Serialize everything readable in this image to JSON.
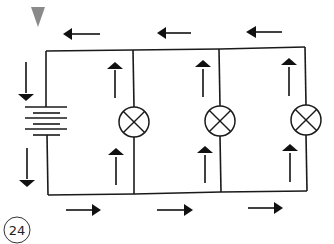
{
  "figure": {
    "number_label": "24",
    "colors": {
      "line": "#1a1a1a",
      "marker_triangle": "#8a8a8a",
      "background": "#ffffff"
    }
  },
  "circuit": {
    "battery": {
      "cells": 3,
      "symbol": "battery-icon"
    },
    "lamps": [
      {
        "id": "lamp-1",
        "symbol": "lamp-icon"
      },
      {
        "id": "lamp-2",
        "symbol": "lamp-icon"
      },
      {
        "id": "lamp-3",
        "symbol": "lamp-icon"
      }
    ],
    "current_arrows": {
      "top_wire": [
        "left",
        "left",
        "left"
      ],
      "bottom_wire": [
        "right",
        "right",
        "right"
      ],
      "battery_side": [
        "down",
        "down"
      ],
      "lamp_branches": [
        "up",
        "up",
        "up",
        "up",
        "up",
        "up"
      ]
    }
  }
}
